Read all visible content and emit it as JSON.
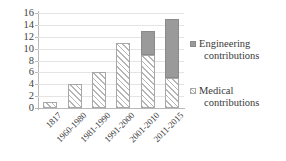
{
  "chart_data": {
    "type": "bar",
    "subtype": "stacked-bar",
    "title": "",
    "xlabel": "",
    "ylabel": "",
    "ylim": [
      0,
      16
    ],
    "ytick_step": 2,
    "yticks": [
      16,
      14,
      12,
      10,
      8,
      6,
      4,
      2,
      0
    ],
    "grid": true,
    "grid_axis": "y",
    "legend_position": "right",
    "categories": [
      "1817",
      "1960-1980",
      "1981-1990",
      "1991-2000",
      "2001-2010",
      "2011-2015"
    ],
    "series": [
      {
        "name": "Medical contributions",
        "color": "#f2f2f2",
        "pattern": "diagonal-hatch",
        "values": [
          1,
          4,
          6,
          11,
          9,
          5
        ]
      },
      {
        "name": "Engineering contributions",
        "color": "#9a9a9a",
        "pattern": "solid",
        "values": [
          0,
          0,
          0,
          0,
          4,
          10
        ]
      }
    ],
    "totals": [
      1,
      4,
      6,
      11,
      13,
      15
    ]
  },
  "axes": {
    "y_tick_labels": [
      "16",
      "14",
      "12",
      "10",
      "8",
      "6",
      "4",
      "2",
      "0"
    ],
    "x_tick_labels": [
      "1817",
      "1960-1980",
      "1981-1990",
      "1991-2000",
      "2001-2010",
      "2011-2015"
    ]
  },
  "legend": {
    "entries": [
      {
        "key": "engineering",
        "line1": "Engineering",
        "line2": "contributions",
        "swatch_color": "#9a9a9a"
      },
      {
        "key": "medical",
        "line1": "Medical",
        "line2": "contributions",
        "swatch_color": "#f2f2f2"
      }
    ]
  },
  "colors": {
    "engineering": "#9a9a9a",
    "medical_fill": "#f2f2f2",
    "medical_hatch": "#b5b5b5",
    "axis": "#b9b9b9",
    "gridline": "#e4e4e4",
    "text": "#3a3a3a",
    "background": "#ffffff"
  }
}
